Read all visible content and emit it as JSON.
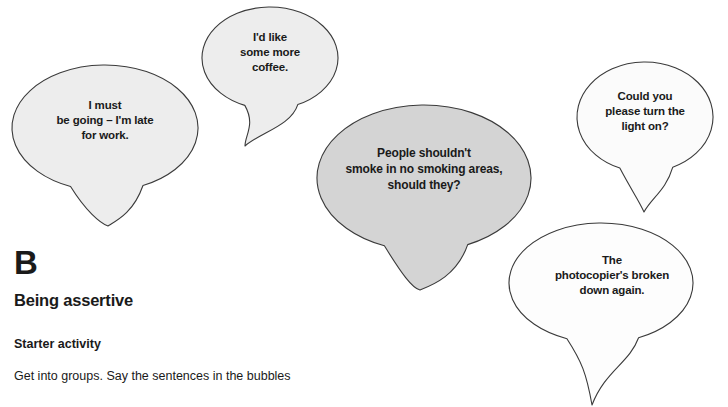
{
  "page": {
    "background_color": "#ffffff",
    "width": 728,
    "height": 407
  },
  "bubbles": [
    {
      "id": "bubble-i-must-be-going",
      "text": "I must\nbe going – I'm late\nfor work.",
      "fill": "#ededed",
      "stroke": "#3a3a3a",
      "cx": 105,
      "cy": 128,
      "rx": 93,
      "ry": 63,
      "tail_x": 108,
      "tail_y": 226
    },
    {
      "id": "bubble-id-like-some-more-coffee",
      "text": "I'd like\nsome more\ncoffee.",
      "fill": "#ededed",
      "stroke": "#3a3a3a",
      "cx": 270,
      "cy": 58,
      "rx": 68,
      "ry": 51,
      "tail_x": 245,
      "tail_y": 146
    },
    {
      "id": "bubble-people-shouldnt-smoke",
      "text": "People shouldn't\nsmoke in no smoking areas,\nshould they?",
      "fill": "#d4d4d4",
      "stroke": "#3a3a3a",
      "cx": 424,
      "cy": 178,
      "rx": 107,
      "ry": 73,
      "tail_x": 420,
      "tail_y": 290
    },
    {
      "id": "bubble-could-you-please-turn-the-light-on",
      "text": "Could you\nplease turn the\nlight on?",
      "fill": "#fbfbfb",
      "stroke": "#3a3a3a",
      "cx": 645,
      "cy": 117,
      "rx": 68,
      "ry": 55,
      "tail_x": 644,
      "tail_y": 212
    },
    {
      "id": "bubble-photocopier-broken-down",
      "text": "The\nphotocopier's broken\ndown again.",
      "fill": "#fdfdfd",
      "stroke": "#3a3a3a",
      "cx": 601,
      "cy": 283,
      "rx": 92,
      "ry": 60,
      "tail_x": 592,
      "tail_y": 405
    }
  ],
  "section": {
    "letter": "B",
    "title": "Being assertive",
    "subsection_title": "Starter activity",
    "body_text": "Get into groups. Say the sentences in the bubbles"
  }
}
